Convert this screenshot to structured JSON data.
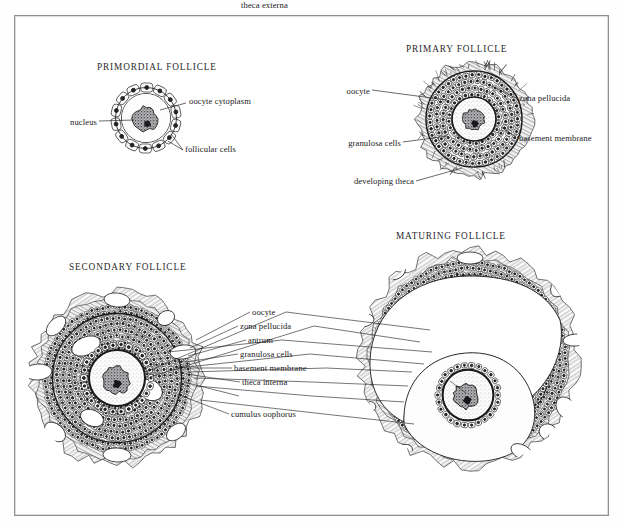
{
  "figure": {
    "title_absent": "",
    "panels": [
      {
        "id": "primordial",
        "heading": "PRIMORDIAL FOLLICLE",
        "labels": [
          {
            "id": "oocyte-cytoplasm",
            "text": "oocyte cytoplasm"
          },
          {
            "id": "nucleus",
            "text": "nucleus"
          },
          {
            "id": "follicular-cells",
            "text": "follicular cells"
          }
        ]
      },
      {
        "id": "primary",
        "heading": "PRIMARY FOLLICLE",
        "labels": [
          {
            "id": "oocyte",
            "text": "oocyte"
          },
          {
            "id": "zona-pellucida",
            "text": "zona pellucida"
          },
          {
            "id": "granulosa-cells",
            "text": "granulosa cells"
          },
          {
            "id": "basement-membrane",
            "text": "basement membrane"
          },
          {
            "id": "developing-theca",
            "text": "developing theca"
          }
        ]
      },
      {
        "id": "secondary",
        "heading": "SECONDARY FOLLICLE"
      },
      {
        "id": "maturing",
        "heading": "MATURING FOLLICLE"
      }
    ],
    "shared_labels": [
      {
        "id": "oocyte",
        "text": "oocyte"
      },
      {
        "id": "zona-pellucida",
        "text": "zona pellucida"
      },
      {
        "id": "antrum",
        "text": "antrum"
      },
      {
        "id": "granulosa-cells",
        "text": "granulosa cells"
      },
      {
        "id": "basement-membrane",
        "text": "basement membrane"
      },
      {
        "id": "theca-interna",
        "text": "theca interna"
      },
      {
        "id": "theca-externa",
        "text": "theca externa"
      },
      {
        "id": "cumulus-oophorus",
        "text": "cumulus oophorus"
      }
    ],
    "colors": {
      "ink": "#1a1a1c",
      "frame": "#8e9092",
      "paper": "#ffffff",
      "nucleus_fill": "#5d5d5f",
      "cell_fill": "#fbfbfb"
    }
  }
}
